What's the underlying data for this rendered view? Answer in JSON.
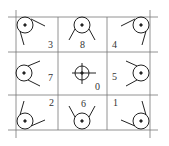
{
  "diagram": {
    "cells": [
      {
        "row": 0,
        "col": 0,
        "label": "3",
        "glyph": "pulley-top-left"
      },
      {
        "row": 0,
        "col": 1,
        "label": "8",
        "glyph": "pulley-top"
      },
      {
        "row": 0,
        "col": 2,
        "label": "4",
        "glyph": "pulley-top-right"
      },
      {
        "row": 1,
        "col": 0,
        "label": "7",
        "glyph": "pulley-left"
      },
      {
        "row": 1,
        "col": 1,
        "label": "0",
        "glyph": "crosshair-center"
      },
      {
        "row": 1,
        "col": 2,
        "label": "5",
        "glyph": "pulley-right"
      },
      {
        "row": 2,
        "col": 0,
        "label": "2",
        "glyph": "pulley-bottom-left"
      },
      {
        "row": 2,
        "col": 1,
        "label": "6",
        "glyph": "pulley-bottom"
      },
      {
        "row": 2,
        "col": 2,
        "label": "1",
        "glyph": "pulley-bottom-right"
      }
    ],
    "colors": {
      "line": "#555555",
      "glyph": "#222222",
      "background": "#ffffff"
    }
  }
}
